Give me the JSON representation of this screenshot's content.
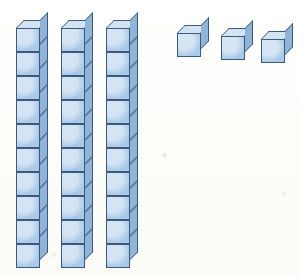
{
  "figure": {
    "description": "Three rods of ten unit cubes and three single unit cubes",
    "background_color": "#fdfdfb"
  },
  "colors": {
    "cube_front": "#a9c9e8",
    "cube_top": "#d2e3f4",
    "cube_side": "#8fb4d8",
    "outline": "#3d5a7d"
  },
  "chart_data": {
    "type": "bar",
    "xlabel": "",
    "ylabel": "Unit cubes",
    "categories": [
      "Rod 1",
      "Rod 2",
      "Rod 3",
      "Unit 1",
      "Unit 2",
      "Unit 3"
    ],
    "values": [
      10,
      10,
      10,
      1,
      1,
      1
    ],
    "ylim": [
      0,
      10
    ],
    "grid": false,
    "legend": "none",
    "total": 33,
    "tens": 3,
    "ones": 3
  },
  "blocks": {
    "rods": [
      {
        "name": "rod-1",
        "cubes": 10,
        "value": 10,
        "x": 16,
        "y": 20
      },
      {
        "name": "rod-2",
        "cubes": 10,
        "value": 10,
        "x": 61,
        "y": 20
      },
      {
        "name": "rod-3",
        "cubes": 10,
        "value": 10,
        "x": 106,
        "y": 20
      }
    ],
    "units": [
      {
        "name": "unit-cube-1",
        "value": 1,
        "x": 177,
        "y": 25
      },
      {
        "name": "unit-cube-2",
        "value": 1,
        "x": 221,
        "y": 28
      },
      {
        "name": "unit-cube-3",
        "value": 1,
        "x": 261,
        "y": 31
      }
    ]
  },
  "labels": {
    "rod_label": "rod of ten",
    "unit_label": "unit cube",
    "total_label": "33"
  }
}
